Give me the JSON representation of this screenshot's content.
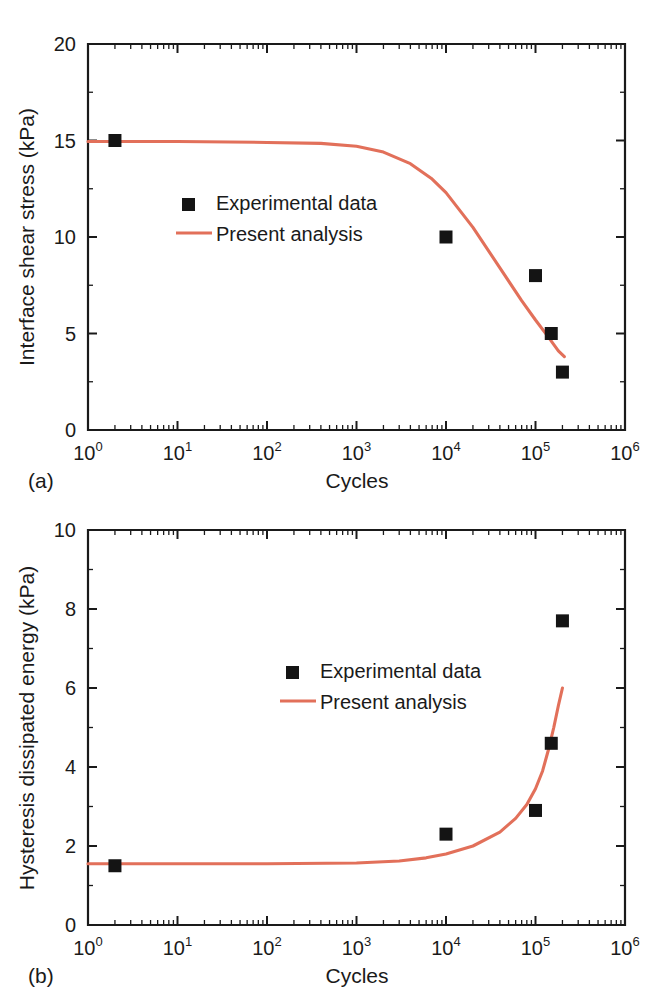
{
  "figure": {
    "panels": [
      {
        "id": "a",
        "panel_label": "(a)"
      },
      {
        "id": "b",
        "panel_label": "(b)"
      }
    ],
    "legend": {
      "experimental_label": "Experimental data",
      "analysis_label": "Present analysis"
    },
    "colors": {
      "curve": "#e2705a",
      "marker": "#141414",
      "axis": "#1a1a1a",
      "background": "#ffffff"
    }
  },
  "chart_data": [
    {
      "type": "scatter",
      "title": "",
      "panel": "(a)",
      "xlabel": "Cycles",
      "ylabel": "Interface shear stress (kPa)",
      "xscale": "log",
      "yscale": "linear",
      "xlim": [
        1,
        1000000
      ],
      "ylim": [
        0,
        20
      ],
      "xticklabels": [
        "10^0",
        "10^1",
        "10^2",
        "10^3",
        "10^4",
        "10^5",
        "10^6"
      ],
      "xtickvalues": [
        1,
        10,
        100,
        1000,
        10000,
        100000,
        1000000
      ],
      "yticklabels": [
        "0",
        "5",
        "10",
        "15",
        "20"
      ],
      "ytickvalues": [
        0,
        5,
        10,
        15,
        20
      ],
      "grid": false,
      "legend_position": "center-left",
      "series": [
        {
          "name": "Experimental data",
          "type": "scatter",
          "marker": "square",
          "color": "#141414",
          "points": [
            {
              "x": 2,
              "y": 15.0
            },
            {
              "x": 10000,
              "y": 10.0
            },
            {
              "x": 100000,
              "y": 8.0
            },
            {
              "x": 150000,
              "y": 5.0
            },
            {
              "x": 200000,
              "y": 3.0
            }
          ]
        },
        {
          "name": "Present analysis",
          "type": "line",
          "color": "#e2705a",
          "points": [
            {
              "x": 1,
              "y": 14.95
            },
            {
              "x": 10,
              "y": 14.95
            },
            {
              "x": 100,
              "y": 14.9
            },
            {
              "x": 400,
              "y": 14.85
            },
            {
              "x": 1000,
              "y": 14.7
            },
            {
              "x": 2000,
              "y": 14.4
            },
            {
              "x": 4000,
              "y": 13.8
            },
            {
              "x": 7000,
              "y": 13.0
            },
            {
              "x": 10000,
              "y": 12.3
            },
            {
              "x": 20000,
              "y": 10.5
            },
            {
              "x": 40000,
              "y": 8.4
            },
            {
              "x": 70000,
              "y": 6.7
            },
            {
              "x": 100000,
              "y": 5.7
            },
            {
              "x": 140000,
              "y": 4.8
            },
            {
              "x": 180000,
              "y": 4.1
            },
            {
              "x": 210000,
              "y": 3.8
            }
          ]
        }
      ]
    },
    {
      "type": "scatter",
      "title": "",
      "panel": "(b)",
      "xlabel": "Cycles",
      "ylabel": "Hysteresis dissipated energy (kPa)",
      "xscale": "log",
      "yscale": "linear",
      "xlim": [
        1,
        1000000
      ],
      "ylim": [
        0,
        10
      ],
      "xticklabels": [
        "10^0",
        "10^1",
        "10^2",
        "10^3",
        "10^4",
        "10^5",
        "10^6"
      ],
      "xtickvalues": [
        1,
        10,
        100,
        1000,
        10000,
        100000,
        1000000
      ],
      "yticklabels": [
        "0",
        "2",
        "4",
        "6",
        "8",
        "10"
      ],
      "ytickvalues": [
        0,
        2,
        4,
        6,
        8,
        10
      ],
      "grid": false,
      "legend_position": "center",
      "series": [
        {
          "name": "Experimental data",
          "type": "scatter",
          "marker": "square",
          "color": "#141414",
          "points": [
            {
              "x": 2,
              "y": 1.5
            },
            {
              "x": 10000,
              "y": 2.3
            },
            {
              "x": 100000,
              "y": 2.9
            },
            {
              "x": 150000,
              "y": 4.6
            },
            {
              "x": 200000,
              "y": 7.7
            }
          ]
        },
        {
          "name": "Present analysis",
          "type": "line",
          "color": "#e2705a",
          "points": [
            {
              "x": 1,
              "y": 1.55
            },
            {
              "x": 100,
              "y": 1.55
            },
            {
              "x": 1000,
              "y": 1.57
            },
            {
              "x": 3000,
              "y": 1.62
            },
            {
              "x": 6000,
              "y": 1.7
            },
            {
              "x": 10000,
              "y": 1.8
            },
            {
              "x": 20000,
              "y": 2.0
            },
            {
              "x": 40000,
              "y": 2.35
            },
            {
              "x": 60000,
              "y": 2.7
            },
            {
              "x": 80000,
              "y": 3.05
            },
            {
              "x": 100000,
              "y": 3.45
            },
            {
              "x": 120000,
              "y": 3.9
            },
            {
              "x": 140000,
              "y": 4.45
            },
            {
              "x": 160000,
              "y": 5.0
            },
            {
              "x": 180000,
              "y": 5.55
            },
            {
              "x": 200000,
              "y": 6.0
            }
          ]
        }
      ]
    }
  ]
}
